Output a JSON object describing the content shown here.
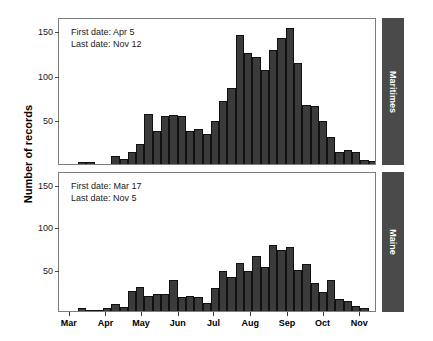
{
  "chart_data": {
    "type": "bar",
    "title": "",
    "xlabel": "",
    "ylabel": "Number of records",
    "ylim": [
      0,
      165
    ],
    "yticks": [
      50,
      100,
      150
    ],
    "grid": false,
    "legend_position": "right-strip",
    "xaxis": {
      "tick_labels": [
        "Mar",
        "Apr",
        "May",
        "Jun",
        "Jul",
        "Aug",
        "Sep",
        "Oct",
        "Nov"
      ],
      "tick_positions_day": [
        0,
        31,
        61,
        92,
        122,
        153,
        184,
        214,
        245
      ],
      "xlim_day": [
        -9,
        259
      ],
      "bin_width_days": 7
    },
    "panels": [
      {
        "name": "Maritimes",
        "strip_label": "Maritimes",
        "annotations": {
          "first_date_label": "First date: Apr 5",
          "last_date_label": "Last date: Nov 12"
        },
        "bin_starts_day": [
          -7,
          0,
          7,
          14,
          21,
          28,
          35,
          42,
          49,
          56,
          63,
          70,
          77,
          84,
          91,
          98,
          105,
          112,
          119,
          126,
          133,
          140,
          147,
          154,
          161,
          168,
          175,
          182,
          189,
          196,
          203,
          210,
          217,
          224,
          231,
          238,
          245,
          252
        ],
        "values": [
          0,
          0,
          2,
          2,
          0,
          0,
          9,
          6,
          14,
          22,
          56,
          37,
          54,
          55,
          54,
          37,
          39,
          34,
          48,
          71,
          85,
          145,
          125,
          120,
          105,
          128,
          141,
          153,
          113,
          66,
          65,
          48,
          30,
          13,
          16,
          14,
          5,
          3
        ]
      },
      {
        "name": "Maine",
        "strip_label": "Maine",
        "annotations": {
          "first_date_label": "First date: Mar 17",
          "last_date_label": "Last date: Nov 5"
        },
        "bin_starts_day": [
          -7,
          0,
          7,
          14,
          21,
          28,
          35,
          42,
          49,
          56,
          63,
          70,
          77,
          84,
          91,
          98,
          105,
          112,
          119,
          126,
          133,
          140,
          147,
          154,
          161,
          168,
          175,
          182,
          189,
          196,
          203,
          210,
          217,
          224,
          231,
          238,
          245,
          252
        ],
        "values": [
          0,
          0,
          3,
          1,
          1,
          4,
          8,
          5,
          24,
          28,
          18,
          20,
          20,
          36,
          16,
          18,
          17,
          9,
          27,
          47,
          40,
          57,
          47,
          65,
          52,
          78,
          72,
          76,
          48,
          55,
          33,
          22,
          36,
          14,
          12,
          6,
          3,
          0
        ]
      }
    ]
  }
}
